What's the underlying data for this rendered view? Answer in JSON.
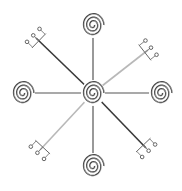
{
  "diagram": {
    "title": "Eight-armed spiral sigil",
    "center": {
      "x": 93,
      "y": 93,
      "rings": 3
    },
    "colors": {
      "background": "#ffffff",
      "stroke_dark": "#3a3a3a",
      "stroke_light": "#b8b8b8"
    },
    "nodes": [
      {
        "id": "top",
        "x": 93,
        "y": 25,
        "kind": "spiral",
        "rings": 3
      },
      {
        "id": "right",
        "x": 161,
        "y": 93,
        "kind": "spiral",
        "rings": 3
      },
      {
        "id": "bottom",
        "x": 93,
        "y": 166,
        "kind": "spiral",
        "rings": 3
      },
      {
        "id": "left",
        "x": 23,
        "y": 93,
        "kind": "spiral",
        "rings": 3
      }
    ],
    "branches": [
      {
        "id": "nw",
        "end": {
          "x": 36,
          "y": 38
        },
        "kind": "forked",
        "prongs": 3,
        "shade": "dark"
      },
      {
        "id": "ne",
        "end": {
          "x": 148,
          "y": 50
        },
        "kind": "forked",
        "prongs": 3,
        "shade": "light"
      },
      {
        "id": "sw",
        "end": {
          "x": 40,
          "y": 150
        },
        "kind": "forked",
        "prongs": 3,
        "shade": "light"
      },
      {
        "id": "se",
        "end": {
          "x": 146,
          "y": 148
        },
        "kind": "forked",
        "prongs": 3,
        "shade": "dark"
      }
    ]
  }
}
